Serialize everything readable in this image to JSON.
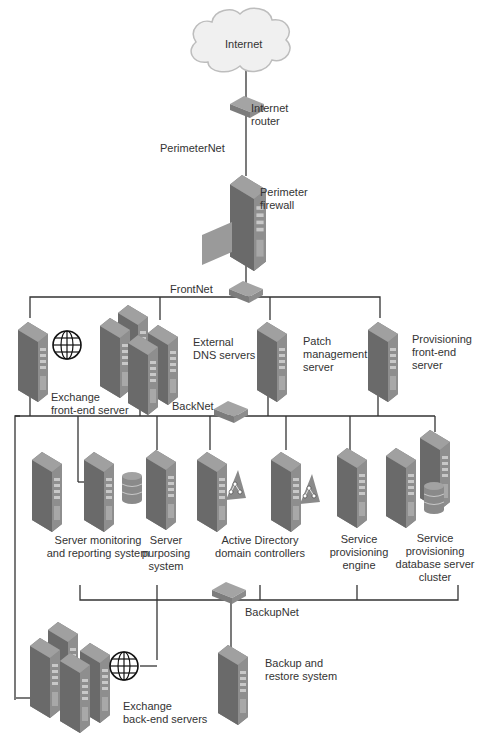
{
  "diagram": {
    "type": "network-topology",
    "colors": {
      "line": "#333333",
      "server_front": "#8a8a8a",
      "server_side": "#6e6e6e",
      "server_top": "#9c9c9c",
      "text": "#333333",
      "cloud": "#f2f2f2"
    },
    "nodes": {
      "internet": {
        "label": "Internet"
      },
      "internet_router": {
        "line1": "Internet",
        "line2": "router"
      },
      "perimeter_firewall": {
        "line1": "Perimeter",
        "line2": "firewall"
      },
      "exchange_frontend": {
        "line1": "Exchange",
        "line2": "front-end server"
      },
      "external_dns": {
        "line1": "External",
        "line2": "DNS servers"
      },
      "patch_management": {
        "line1": "Patch",
        "line2": "management",
        "line3": "server"
      },
      "provisioning_frontend": {
        "line1": "Provisioning",
        "line2": "front-end",
        "line3": "server"
      },
      "server_monitoring": {
        "line1": "Server monitoring",
        "line2": "and reporting system"
      },
      "server_purposing": {
        "line1": "Server",
        "line2": "purposing",
        "line3": "system"
      },
      "active_directory": {
        "line1": "Active Directory",
        "line2": "domain controllers"
      },
      "service_provisioning_engine": {
        "line1": "Service",
        "line2": "provisioning",
        "line3": "engine"
      },
      "service_provisioning_db": {
        "line1": "Service",
        "line2": "provisioning",
        "line3": "database server",
        "line4": "cluster"
      },
      "exchange_backend": {
        "line1": "Exchange",
        "line2": "back-end servers"
      },
      "backup_restore": {
        "line1": "Backup and",
        "line2": "restore system"
      }
    },
    "networks": {
      "perimeter": "PerimeterNet",
      "front": "FrontNet",
      "back": "BackNet",
      "backup": "BackupNet"
    }
  }
}
